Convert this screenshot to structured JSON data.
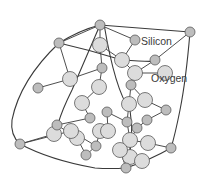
{
  "diagram": {
    "labels": [
      {
        "id": "silicon",
        "text": "Silicon"
      },
      {
        "id": "oxygen",
        "text": "Oxygen"
      }
    ],
    "legend": {
      "silicon": {
        "text": "Silicon",
        "color": "#bdbdbd"
      },
      "oxygen": {
        "text": "Oxygen",
        "color": "#dcdcdc"
      }
    },
    "atom_types": {
      "Si": {
        "name": "silicon",
        "fill": "#bdbdbd"
      },
      "O": {
        "name": "oxygen",
        "fill": "#dcdcdc"
      }
    },
    "atoms": [
      {
        "id": "a1",
        "type": "Si"
      },
      {
        "id": "a2",
        "type": "Si"
      },
      {
        "id": "a3",
        "type": "O"
      },
      {
        "id": "a4",
        "type": "Si"
      },
      {
        "id": "a5",
        "type": "Si"
      },
      {
        "id": "a6",
        "type": "O"
      },
      {
        "id": "a7",
        "type": "Si"
      },
      {
        "id": "a8",
        "type": "O"
      },
      {
        "id": "a9",
        "type": "Si"
      },
      {
        "id": "a10",
        "type": "O"
      },
      {
        "id": "a11",
        "type": "Si"
      },
      {
        "id": "a12",
        "type": "O"
      },
      {
        "id": "a13",
        "type": "O"
      },
      {
        "id": "a14",
        "type": "Si"
      },
      {
        "id": "a15",
        "type": "O"
      },
      {
        "id": "a16",
        "type": "Si"
      },
      {
        "id": "a17",
        "type": "O"
      },
      {
        "id": "a18",
        "type": "O"
      },
      {
        "id": "a19",
        "type": "Si"
      },
      {
        "id": "a20",
        "type": "O"
      },
      {
        "id": "a21",
        "type": "Si"
      },
      {
        "id": "a22",
        "type": "O"
      },
      {
        "id": "a23",
        "type": "Si"
      },
      {
        "id": "a24",
        "type": "O"
      },
      {
        "id": "a25",
        "type": "O"
      },
      {
        "id": "a26",
        "type": "Si"
      },
      {
        "id": "a27",
        "type": "O"
      },
      {
        "id": "a28",
        "type": "O"
      },
      {
        "id": "a29",
        "type": "Si"
      },
      {
        "id": "a30",
        "type": "Si"
      },
      {
        "id": "a31",
        "type": "O"
      },
      {
        "id": "a32",
        "type": "Si"
      },
      {
        "id": "a33",
        "type": "O"
      },
      {
        "id": "a34",
        "type": "Si"
      },
      {
        "id": "a35",
        "type": "O"
      },
      {
        "id": "a36",
        "type": "O"
      },
      {
        "id": "a37",
        "type": "Si"
      },
      {
        "id": "a38",
        "type": "Si"
      },
      {
        "id": "a39",
        "type": "Si"
      }
    ]
  }
}
